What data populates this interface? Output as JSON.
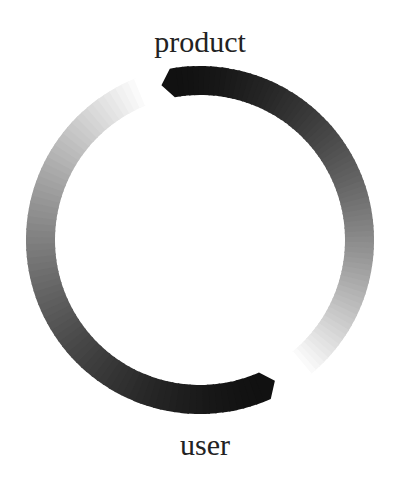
{
  "diagram": {
    "type": "circular-flow",
    "nodes": [
      {
        "id": "product",
        "label": "product",
        "position": "top"
      },
      {
        "id": "user",
        "label": "user",
        "position": "bottom"
      }
    ],
    "links": [
      {
        "from": "product",
        "to": "user",
        "side": "right",
        "color_start": "#111111",
        "color_end": "#ffffff"
      },
      {
        "from": "user",
        "to": "product",
        "side": "left",
        "color_start": "#111111",
        "color_end": "#ffffff"
      }
    ]
  }
}
